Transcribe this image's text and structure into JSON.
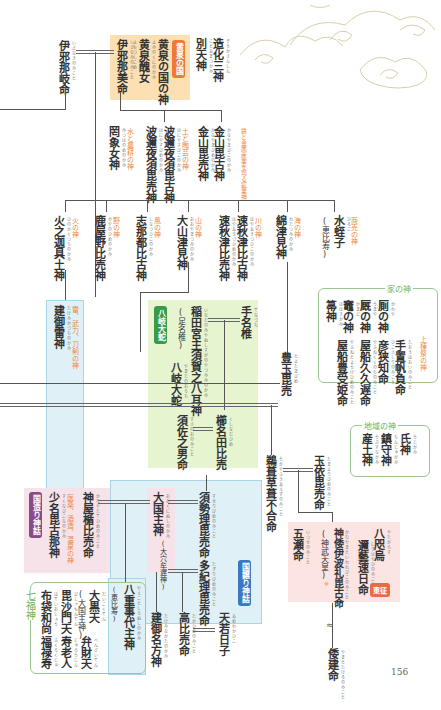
{
  "diagram": {
    "type": "genealogy-chart",
    "page_number": "156",
    "section_tags": {
      "yomi": "黄泉の国",
      "yamata": "八岐大蛇",
      "kunizukuri": "国造り神話",
      "kuniyuzuri": "国譲り神話",
      "tousei": "東征",
      "shichifukujin": "七福神"
    },
    "nodes": {
      "izanagi": {
        "name": "伊邪那岐命",
        "ruby": "いざなきのみこと"
      },
      "izanami": {
        "name": "伊邪那美命",
        "ruby": "いざなみのみこと"
      },
      "yomotsu_okami": {
        "name": "黄泉の国の神",
        "ruby": "よみのくにのかみ"
      },
      "yomotsu_shikome": {
        "name": "黄泉醜女",
        "ruby": "よもつしこめ"
      },
      "zouka_sanshin": {
        "name": "造化三神",
        "ruby": "ぞうかさんしん"
      },
      "betsuamatsukami": {
        "name": "別天神",
        "ruby": "ことあまつかみ"
      },
      "mizuhanome": {
        "name": "罔象女神",
        "ruby": "みつはのめのかみ",
        "role": "水と農耕の神"
      },
      "haniyasubiko": {
        "name": "波邇夜須毘古神",
        "ruby": "はにやすびこのかみ",
        "role": "土と陶芸の神"
      },
      "haniyasubime": {
        "name": "波邇夜須毘売神",
        "ruby": "はにやすびめのかみ"
      },
      "kanayamabiko": {
        "name": "金山毘古神",
        "ruby": "かなやまびこのかみ",
        "role": "鉄と金属産業を司る鉱業神"
      },
      "kanayamabime": {
        "name": "金山毘売神",
        "ruby": "かなやまびめのかみ"
      },
      "kagutsuchi": {
        "name": "火之迦具土神",
        "ruby": "ひのかぐつちのかみ",
        "role": "火の神"
      },
      "kayanohime": {
        "name": "鹿屋野比売神",
        "ruby": "かやのひめのかみ",
        "role": "野の神"
      },
      "shinatsuhiko": {
        "name": "志那都比古神",
        "ruby": "しなつひこのかみ",
        "role": "風の神"
      },
      "oyamatsumi": {
        "name": "大山津見神",
        "ruby": "おおやまつみのかみ",
        "role": "山の神"
      },
      "hayaakitsuhiko": {
        "name": "速秋津比古神",
        "ruby": "はやあきつひこのかみ",
        "role": "川の神"
      },
      "hayaakitsuhime": {
        "name": "速秋津比売神",
        "ruby": "はやあきつひめのかみ"
      },
      "watatsumi": {
        "name": "綿津見神",
        "ruby": "わたつみのかみ",
        "role": "海の神"
      },
      "hiruko": {
        "name": "水蛭子",
        "ruby": "ひるこ",
        "alt": "(恵比寿)",
        "role": "商売の神"
      },
      "takemikazuchi": {
        "name": "建御雷神",
        "ruby": "たけみかづちのかみ",
        "role": "雷、武力、刀剣の神"
      },
      "ashinazuchi": {
        "name": "足名椎",
        "ruby": "あしなづち"
      },
      "tenazuchi": {
        "name": "手名椎",
        "ruby": "てなづち"
      },
      "inadanomiya": {
        "name": "稲田宮主須賀之八耳神",
        "ruby": "いなだのみやぬしすがのやつみみのかみ",
        "alt": "(足名椎)"
      },
      "yamatanoorochi": {
        "name": "八岐大蛇",
        "ruby": "やまたのおろち"
      },
      "kushinadahime": {
        "name": "櫛名田比売",
        "ruby": "くしなだひめ"
      },
      "susanoo": {
        "name": "須佐之男命",
        "ruby": "すさのおのみこと",
        "mark": "※"
      },
      "toyotamahime": {
        "name": "豊玉毘売",
        "ruby": "とよたまびめ"
      },
      "ugayafukiaezu": {
        "name": "鵜葺草葺不合命",
        "ruby": "うがやふきあえずのみこと"
      },
      "tamayorihime": {
        "name": "玉依毘売命",
        "ruby": "たまよりびめのみこと"
      },
      "suseribime": {
        "name": "須勢理毘売命",
        "ruby": "すせりびめのみこと"
      },
      "okuninushi": {
        "name": "大国主神",
        "ruby": "おおくにぬしのかみ",
        "alt": "(大穴牟遅神)"
      },
      "kamumusubi": {
        "name": "神屋楯比売命",
        "ruby": "かむやたてひめのみこと"
      },
      "sukunabikona": {
        "name": "少名毘古那神",
        "ruby": "すくなびこなのかみ",
        "role": "医薬、酒造、温泉の神"
      },
      "takiribime": {
        "name": "多紀理毘売命",
        "ruby": "たぎりびめのみこと"
      },
      "takahime": {
        "name": "高比売命",
        "ruby": "たかひめのみこと"
      },
      "amewakahiko": {
        "name": "天若日子",
        "ruby": "あめわかひこ"
      },
      "kotoshironushi": {
        "name": "八重事代主神",
        "ruby": "やえことしろぬしのかみ",
        "alt": "(恵比寿)"
      },
      "takeminakata": {
        "name": "建御名方神",
        "ruby": "たけみなかたのかみ"
      },
      "itsuse": {
        "name": "五瀬命",
        "ruby": "いつせのみこと"
      },
      "jimmu": {
        "name": "神倭伊波礼毘古命",
        "ruby": "かむやまといわれびこのみこと",
        "alt": "(神武天皇)",
        "mark": "※"
      },
      "yatagarasu": {
        "name": "八咫烏",
        "ruby": "やたがらす"
      },
      "nigihayahi": {
        "name": "邇藝速日命",
        "ruby": "にぎはやひのみこと"
      },
      "yamatotakeru": {
        "name": "倭建命",
        "ruby": "やまとたけるのみこと"
      }
    },
    "groups": {
      "ie_no_kami": {
        "title": "家の神",
        "items": [
          {
            "name": "厠の神",
            "ruby": "かわや"
          },
          {
            "name": "厩の神",
            "ruby": "うまや"
          },
          {
            "name": "竈の神",
            "ruby": "かまど"
          },
          {
            "name": "箒神",
            "ruby": "ははきがみ"
          },
          {
            "name": "手置帆負命",
            "ruby": "たおきほおいのみこと",
            "role": "上棟祭の神"
          },
          {
            "name": "彦狭知命",
            "ruby": "ひこさしりのみこと"
          },
          {
            "name": "屋船久久遅命",
            "ruby": "やふねくくのちのみこと"
          },
          {
            "name": "屋船豊受姫命",
            "ruby": "やふねとようけひめのみこと"
          }
        ]
      },
      "chiiki_no_kami": {
        "title": "地域の神",
        "items": [
          {
            "name": "氏神",
            "ruby": "うじがみ"
          },
          {
            "name": "鎮守神",
            "ruby": "ちんじゅがみ"
          },
          {
            "name": "産土神",
            "ruby": "うぶすながみ"
          }
        ]
      },
      "shichifukujin": {
        "title": "七福神",
        "items": [
          {
            "name": "大黒天",
            "ruby": "だいこくてん",
            "alt": "(大国主神)"
          },
          {
            "name": "弁財天",
            "ruby": "べんざいてん"
          },
          {
            "name": "毘沙門天",
            "ruby": "びしゃもんてん"
          },
          {
            "name": "寿老人",
            "ruby": "じゅろうじん"
          },
          {
            "name": "布袋和尚",
            "ruby": "ほていおしょう"
          },
          {
            "name": "福禄寿",
            "ruby": "ふくろくじゅ"
          }
        ]
      }
    },
    "colors": {
      "yomi_box": "#fce0b3",
      "yamata_box": "#e6f4d0",
      "blue_box": "#dff1f6",
      "pink_box": "#f6e3ea",
      "tousei_box": "#fbe4e2",
      "role_text": "#f08a3c",
      "group_green": "#6ab35a",
      "tag_orange": "#ee7a35",
      "tag_green": "#3b9a4a",
      "tag_purple": "#8a4a8a",
      "tag_blue": "#3a78c2"
    }
  }
}
